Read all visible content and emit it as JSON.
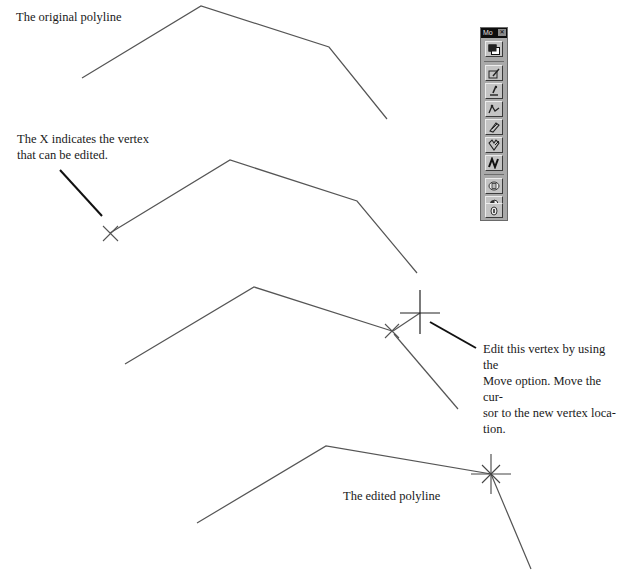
{
  "labels": {
    "original": "The original polyline",
    "x_indicates_line1": "The X indicates the vertex",
    "x_indicates_line2": "that can be edited.",
    "edit_line1": "Edit this vertex by using the",
    "edit_line2": "Move option. Move the cur-",
    "edit_line3": "sor to the new vertex loca-",
    "edit_line4": "tion.",
    "edited": "The edited polyline"
  },
  "toolbar": {
    "title": "Mo",
    "close_glyph": "✕",
    "buttons": [
      {
        "name": "modify-properties-icon"
      },
      {
        "name": "edit-entity-icon"
      },
      {
        "name": "edit-text-icon"
      },
      {
        "name": "edit-polyline-icon"
      },
      {
        "name": "explode-icon"
      },
      {
        "name": "break-icon"
      },
      {
        "name": "edit-spline-icon"
      },
      {
        "name": "extend-icon"
      },
      {
        "name": "trim-icon"
      },
      {
        "name": "stretch-icon"
      }
    ]
  },
  "diagram": {
    "stroke_color": "#555555",
    "callout_color": "#111111",
    "polylines": [
      {
        "name": "original-polyline",
        "points": [
          [
            82,
            78
          ],
          [
            201,
            6
          ],
          [
            329,
            47
          ],
          [
            387,
            119
          ]
        ]
      },
      {
        "name": "editing-polyline",
        "points": [
          [
            110,
            233
          ],
          [
            230,
            160
          ],
          [
            357,
            201
          ],
          [
            417,
            273
          ]
        ]
      },
      {
        "name": "moving-polyline",
        "points": [
          [
            125,
            364
          ],
          [
            254,
            287
          ],
          [
            392,
            331
          ],
          [
            458,
            409
          ]
        ]
      },
      {
        "name": "edited-polyline",
        "points": [
          [
            197,
            523
          ],
          [
            326,
            446
          ],
          [
            491,
            474
          ],
          [
            531,
            569
          ]
        ]
      }
    ]
  }
}
